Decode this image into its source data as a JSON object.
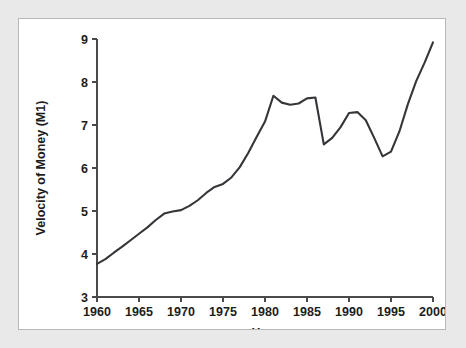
{
  "figure": {
    "background_color": "#e9e9e9",
    "panel_color": "#ffffff",
    "border_color": "#b9b9b9",
    "line_color": "#36363a"
  },
  "chart_data": {
    "type": "line",
    "title": "",
    "subtitle": "",
    "xlabel": "Year",
    "ylabel": "Velocity of Money (M1)",
    "xlim": [
      1960,
      2000
    ],
    "ylim": [
      3,
      9
    ],
    "grid": false,
    "legend": false,
    "legend_position": "none",
    "xticks": [
      1960,
      1965,
      1970,
      1975,
      1980,
      1985,
      1990,
      1995,
      2000
    ],
    "xtick_labels": [
      "1960",
      "1965",
      "1970",
      "1975",
      "1980",
      "1985",
      "1990",
      "1995",
      "2000"
    ],
    "yticks": [
      3,
      4,
      5,
      6,
      7,
      8,
      9
    ],
    "ytick_labels": [
      "3",
      "4",
      "5",
      "6",
      "7",
      "8",
      "9"
    ],
    "series": [
      {
        "name": "Velocity of Money (M1)",
        "x": [
          1960,
          1961,
          1962,
          1963,
          1964,
          1965,
          1966,
          1967,
          1968,
          1969,
          1970,
          1971,
          1972,
          1973,
          1974,
          1975,
          1976,
          1977,
          1978,
          1979,
          1980,
          1981,
          1982,
          1983,
          1984,
          1985,
          1986,
          1987,
          1988,
          1989,
          1990,
          1991,
          1992,
          1993,
          1994,
          1995,
          1996,
          1997,
          1998,
          1999,
          2000
        ],
        "values": [
          3.77,
          3.88,
          4.03,
          4.17,
          4.32,
          4.47,
          4.62,
          4.79,
          4.94,
          4.99,
          5.02,
          5.12,
          5.25,
          5.42,
          5.56,
          5.63,
          5.78,
          6.02,
          6.35,
          6.72,
          7.08,
          7.68,
          7.52,
          7.47,
          7.5,
          7.62,
          7.64,
          6.55,
          6.7,
          6.95,
          7.28,
          7.3,
          7.11,
          6.7,
          6.27,
          6.38,
          6.85,
          7.48,
          8.02,
          8.45,
          8.92
        ]
      }
    ],
    "annotations": []
  },
  "axis_titles": {
    "x": "Year",
    "y": "Velocity of Money (M1)"
  }
}
